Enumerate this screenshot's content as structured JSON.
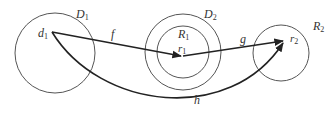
{
  "diagram": {
    "circles": {
      "D1": {
        "label": "D",
        "sub": "1",
        "cx": 55,
        "cy": 53,
        "r": 40
      },
      "D2": {
        "label": "D",
        "sub": "2",
        "cx": 183,
        "cy": 52,
        "r": 38
      },
      "R1": {
        "label": "R",
        "sub": "1",
        "cx": 183,
        "cy": 52,
        "r": 26
      },
      "R2": {
        "label": "R",
        "sub": "2",
        "cx": 281,
        "cy": 53,
        "r": 28
      }
    },
    "points": {
      "d1": {
        "label": "d",
        "sub": "1"
      },
      "r1": {
        "label": "r",
        "sub": "1"
      },
      "r2": {
        "label": "r",
        "sub": "2"
      }
    },
    "arrows": {
      "f": {
        "label": "f",
        "from": "d1",
        "to": "r1"
      },
      "g": {
        "label": "g",
        "from": "r1",
        "to": "r2"
      },
      "h": {
        "label": "h",
        "from": "d1",
        "to": "r2"
      }
    },
    "colors": {
      "stroke": "#333333",
      "circle": "#555555"
    }
  }
}
